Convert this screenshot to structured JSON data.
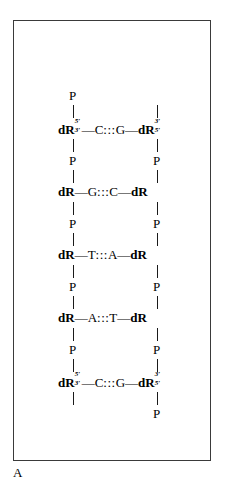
{
  "figure": {
    "panel_label": "A",
    "description_type": "dna-base-pair-ladder",
    "frame": {
      "border_color": "#3a3a3a",
      "background": "#ffffff"
    },
    "text_color": "#000000",
    "sugar_label": "dR",
    "phosphate_label": "P",
    "hydrogen_bond_symbol": ":::",
    "bond_dash": "—",
    "prime_five": "5′",
    "prime_three": "3′",
    "strand_left_name": "left-strand",
    "strand_right_name": "right-strand",
    "terminal_top": {
      "left_phosphate": "P",
      "right_phosphate": ""
    },
    "terminal_bottom": {
      "left_phosphate": "",
      "right_phosphate": "P"
    },
    "base_pairs": [
      {
        "index": 1,
        "left_sugar": "dR",
        "left_sup": "5′",
        "left_sub": "3′",
        "left_base": "C",
        "hbond": ":::",
        "right_base": "G",
        "right_sugar": "dR",
        "right_sup": "3′",
        "right_sub": "5′"
      },
      {
        "index": 2,
        "left_sugar": "dR",
        "left_sup": "",
        "left_sub": "",
        "left_base": "G",
        "hbond": ":::",
        "right_base": "C",
        "right_sugar": "dR",
        "right_sup": "",
        "right_sub": ""
      },
      {
        "index": 3,
        "left_sugar": "dR",
        "left_sup": "",
        "left_sub": "",
        "left_base": "T",
        "hbond": ":::",
        "right_base": "A",
        "right_sugar": "dR",
        "right_sup": "",
        "right_sub": ""
      },
      {
        "index": 4,
        "left_sugar": "dR",
        "left_sup": "",
        "left_sub": "",
        "left_base": "A",
        "hbond": ":::",
        "right_base": "T",
        "right_sugar": "dR",
        "right_sup": "",
        "right_sub": ""
      },
      {
        "index": 5,
        "left_sugar": "dR",
        "left_sup": "5′",
        "left_sub": "3′",
        "left_base": "C",
        "hbond": ":::",
        "right_base": "G",
        "right_sugar": "dR",
        "right_sup": "3′",
        "right_sub": "5′"
      }
    ],
    "interior_phosphates": [
      {
        "after_pair": 1,
        "left": "P",
        "right": "P"
      },
      {
        "after_pair": 2,
        "left": "P",
        "right": "P"
      },
      {
        "after_pair": 3,
        "left": "P",
        "right": "P"
      },
      {
        "after_pair": 4,
        "left": "P",
        "right": "P"
      }
    ]
  }
}
